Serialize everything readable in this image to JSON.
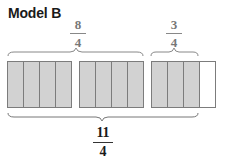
{
  "title": "Model B",
  "top_labels": [
    {
      "numerator": "8",
      "denominator": "4"
    },
    {
      "numerator": "3",
      "denominator": "4"
    }
  ],
  "bottom_label": {
    "numerator": "11",
    "denominator": "4"
  },
  "wholes": [
    {
      "parts": 4,
      "shaded": 4
    },
    {
      "parts": 4,
      "shaded": 4
    },
    {
      "parts": 4,
      "shaded": 3
    }
  ],
  "colors": {
    "shaded": "#d2d2d2",
    "border": "#7c7c7c",
    "unshaded": "#ffffff"
  }
}
